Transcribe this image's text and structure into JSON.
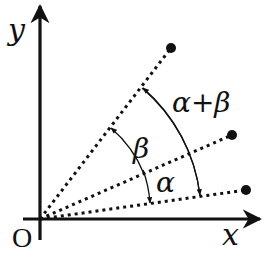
{
  "diagram": {
    "type": "angle-addition",
    "axes": {
      "x_label": "x",
      "y_label": "y",
      "origin_label": "O"
    },
    "rays": [
      {
        "name": "ray-alpha-plus-beta",
        "end": [
          171,
          48
        ]
      },
      {
        "name": "ray-alpha",
        "end": [
          232,
          135
        ]
      },
      {
        "name": "ray-base",
        "end": [
          246,
          190
        ]
      }
    ],
    "angles": [
      {
        "name": "alpha",
        "label": "α"
      },
      {
        "name": "beta",
        "label": "β"
      },
      {
        "name": "alpha-plus-beta",
        "label": "α+β"
      }
    ],
    "colors": {
      "ink": "#111111",
      "background": "#ffffff"
    }
  }
}
